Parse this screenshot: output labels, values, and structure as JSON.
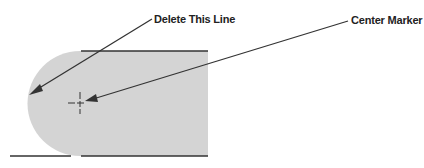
{
  "labels": {
    "delete_line": "Delete This Line",
    "center_marker": "Center Marker"
  },
  "colors": {
    "fill": "#d4d4d4",
    "line": "#333333",
    "text": "#222222"
  }
}
